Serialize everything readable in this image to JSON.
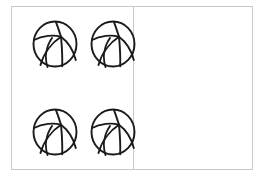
{
  "canvas": {
    "width": 258,
    "height": 181,
    "background": "#ffffff"
  },
  "frame": {
    "border_color": "#c9c9c9",
    "divider_color": "#c9c9c9",
    "label": "two-panel comparison box"
  },
  "icons": {
    "ball": "basketball-icon",
    "ball_outline_color": "#1a1a1a",
    "ball_fill_color": "#ffffff"
  },
  "panels": [
    {
      "id": "left",
      "name": "left-group",
      "count": 4,
      "balls": [
        {
          "id": "l1",
          "name": "basketball-left-1",
          "row": 1,
          "col": 1
        },
        {
          "id": "l2",
          "name": "basketball-left-2",
          "row": 1,
          "col": 2
        },
        {
          "id": "l3",
          "name": "basketball-left-3",
          "row": 2,
          "col": 1
        },
        {
          "id": "l4",
          "name": "basketball-left-4",
          "row": 2,
          "col": 2
        }
      ]
    },
    {
      "id": "right",
      "name": "right-group",
      "count": 2,
      "balls": [
        {
          "id": "r1",
          "name": "basketball-right-1",
          "row": 1,
          "col": 1
        },
        {
          "id": "r2",
          "name": "basketball-right-2",
          "row": 2,
          "col": 2
        }
      ]
    }
  ]
}
